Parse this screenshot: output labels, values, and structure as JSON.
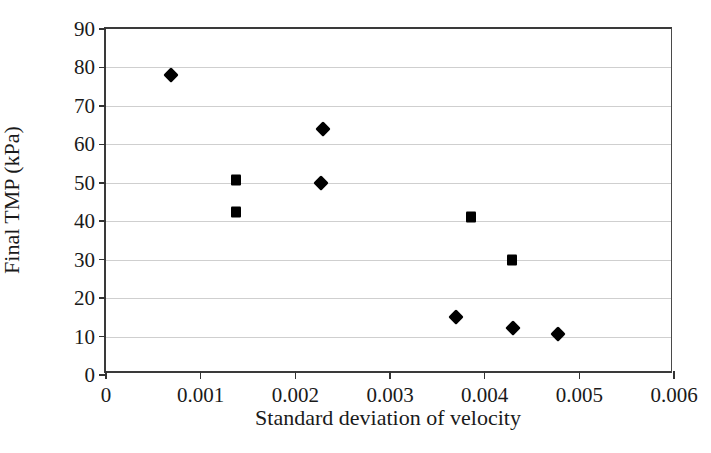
{
  "chart_data": {
    "type": "scatter",
    "title": "",
    "xlabel": "Standard deviation of velocity",
    "ylabel": "Final TMP (kPa)",
    "xlim": [
      0,
      0.006
    ],
    "ylim": [
      0,
      90
    ],
    "xticks": [
      0,
      0.001,
      0.002,
      0.003,
      0.004,
      0.005,
      0.006
    ],
    "xtick_labels": [
      "0",
      "0.001",
      "0.002",
      "0.003",
      "0.004",
      "0.005",
      "0.006"
    ],
    "yticks": [
      0,
      10,
      20,
      30,
      40,
      50,
      60,
      70,
      80,
      90
    ],
    "ytick_labels": [
      "0",
      "10",
      "20",
      "30",
      "40",
      "50",
      "60",
      "70",
      "80",
      "90"
    ],
    "grid": "horizontal",
    "legend": "none",
    "marker_color": "#000000",
    "gridline_color": "#cfcfcf",
    "axis_color": "#3a3a3a",
    "series": [
      {
        "name": "diamond-series",
        "marker": "diamond",
        "points": [
          {
            "x": 0.00069,
            "y": 78.0
          },
          {
            "x": 0.00229,
            "y": 64.0
          },
          {
            "x": 0.00227,
            "y": 50.0
          },
          {
            "x": 0.0037,
            "y": 15.0
          },
          {
            "x": 0.0043,
            "y": 12.2
          },
          {
            "x": 0.00477,
            "y": 10.7
          }
        ]
      },
      {
        "name": "square-series",
        "marker": "square",
        "points": [
          {
            "x": 0.00137,
            "y": 50.6
          },
          {
            "x": 0.00137,
            "y": 42.5
          },
          {
            "x": 0.00386,
            "y": 41.0
          },
          {
            "x": 0.00429,
            "y": 29.9
          }
        ]
      }
    ]
  }
}
